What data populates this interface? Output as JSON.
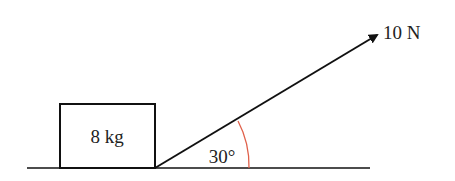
{
  "diagram": {
    "block": {
      "label": "8 kg"
    },
    "force": {
      "label": "10 N"
    },
    "angle": {
      "label": "30°"
    },
    "colors": {
      "line": "#111111",
      "arc": "#e0604a",
      "text": "#222222"
    }
  }
}
